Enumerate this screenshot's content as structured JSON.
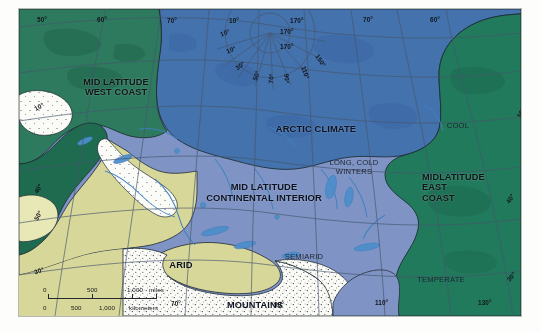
{
  "figure": {
    "kind": "climate-map",
    "projection": "polar-centred graticule"
  },
  "palette": {
    "mid_latitude_west_coast": "#2e7a5e",
    "arctic_climate": "#4472ad",
    "continental_interior": "#7f94c4",
    "east_coast_green": "#227a5c",
    "arid_khaki": "#d8d79a",
    "mountains_white": "#fbfbf8",
    "highland_pale": "#e8e7b6",
    "water_line": "#3f7fc0",
    "graticule_line": "#46566e",
    "boundary_line": "#1d2b33",
    "text_dark": "#101418",
    "frame_white": "#ffffff"
  },
  "regions": [
    {
      "id": "mid-latitude-west-coast",
      "label": "MID LATITUDE\nWEST COAST",
      "color": "#2e7a5e"
    },
    {
      "id": "arctic-climate",
      "label": "ARCTIC CLIMATE",
      "color": "#4472ad"
    },
    {
      "id": "mid-latitude-continental-interior",
      "label": "MID LATITUDE\nCONTINENTAL INTERIOR",
      "color": "#7f94c4"
    },
    {
      "id": "midlatitude-east-coast",
      "label": "MIDLATITUDE\nEAST\nCOAST",
      "color": "#227a5c"
    },
    {
      "id": "arid",
      "label": "ARID",
      "color": "#d8d79a"
    },
    {
      "id": "mountains",
      "label": "MOUNTAINS",
      "color": "#fbfbf8"
    }
  ],
  "annotations": [
    {
      "id": "long-cold-winters",
      "label": "LONG, COLD\nWINTERS"
    },
    {
      "id": "semiarid",
      "label": "SEMIARID"
    },
    {
      "id": "cool",
      "label": "COOL"
    },
    {
      "id": "temperate",
      "label": "TEMPERATE"
    }
  ],
  "graticule": {
    "top": [
      "50°",
      "60°",
      "70°",
      "10°",
      "170°",
      "70°",
      "60°"
    ],
    "bottom": [
      "70°",
      "90°",
      "110°",
      "130°"
    ],
    "left": [
      "10°",
      "40°",
      "50°",
      "30°"
    ],
    "right": [
      "50°",
      "40°",
      "30°"
    ],
    "polar_radial": [
      "10°",
      "10°",
      "30°",
      "50°",
      "70°",
      "90°",
      "110°",
      "150°",
      "170°",
      "170°"
    ]
  },
  "scale_bar": {
    "miles": {
      "ticks": [
        "0",
        "500",
        "1,000"
      ],
      "unit": "miles"
    },
    "kilometers": {
      "ticks": [
        "0",
        "500",
        "1,000"
      ],
      "unit": "kilometers"
    }
  }
}
